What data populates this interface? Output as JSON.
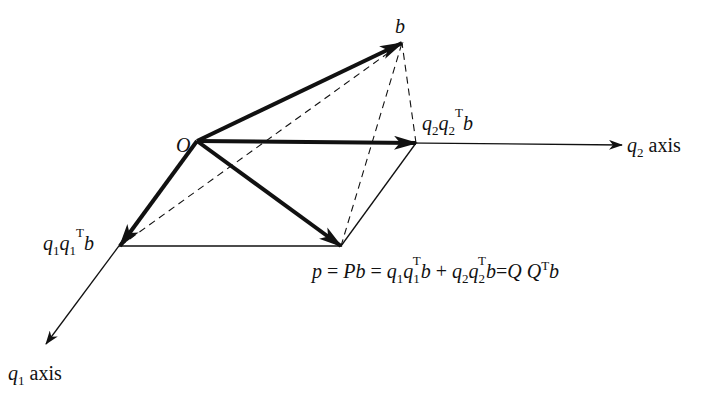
{
  "diagram": {
    "colors": {
      "ink": "#111111",
      "background": "#ffffff"
    },
    "points": {
      "O": [
        197,
        141
      ],
      "b": [
        402,
        43
      ],
      "q2_proj": [
        416,
        143
      ],
      "q1_proj": [
        120,
        246
      ],
      "p": [
        341,
        246
      ],
      "q1_axis_tip": [
        46,
        344
      ],
      "q2_axis_tip": [
        622,
        145
      ]
    },
    "labels": {
      "origin": "O",
      "b": "b",
      "q2_axis": {
        "var": "q",
        "sub": "2",
        "text": "axis"
      },
      "q1_axis": {
        "var": "q",
        "sub": "1",
        "text": "axis"
      },
      "q2_proj": {
        "q": "q",
        "s1": "2",
        "s2": "2",
        "sup": "T",
        "b": "b"
      },
      "q1_proj": {
        "q": "q",
        "s1": "1",
        "s2": "1",
        "sup": "T",
        "b": "b"
      },
      "formula": {
        "p": "p",
        "eq1": " = ",
        "Pb": "Pb",
        "eq2": " = ",
        "q": "q",
        "one": "1",
        "two": "2",
        "T": "T",
        "b": "b",
        "plus": " + ",
        "eq3": "=",
        "QQ": "Q Q"
      }
    },
    "vectors": [
      {
        "name": "b",
        "from": "O",
        "to": "b",
        "style": "thick-arrow"
      },
      {
        "name": "q2q2Tb",
        "from": "O",
        "to": "q2_proj",
        "style": "thick-arrow"
      },
      {
        "name": "q1q1Tb",
        "from": "O",
        "to": "q1_proj",
        "style": "thick-arrow"
      },
      {
        "name": "p",
        "from": "O",
        "to": "p",
        "style": "thick-arrow"
      }
    ],
    "edges": [
      {
        "from": "q1_proj",
        "to": "p",
        "style": "thin"
      },
      {
        "from": "p",
        "to": "q2_proj",
        "style": "thin"
      },
      {
        "from": "q1_proj",
        "to": "b",
        "style": "dashed"
      },
      {
        "from": "p",
        "to": "b",
        "style": "dashed"
      },
      {
        "from": "q2_proj",
        "to": "b",
        "style": "dashed"
      }
    ]
  }
}
